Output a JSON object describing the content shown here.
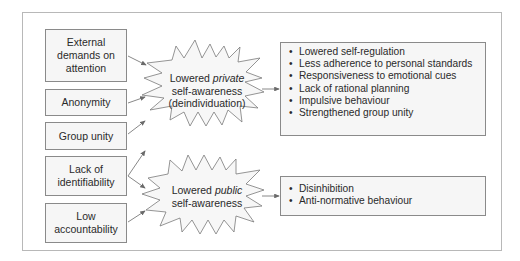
{
  "causes": [
    {
      "label": "External demands on attention"
    },
    {
      "label": "Anonymity"
    },
    {
      "label": "Group unity"
    },
    {
      "label": "Lack of identifiability"
    },
    {
      "label": "Low accountability"
    }
  ],
  "states": {
    "private": {
      "prefix": "Lowered ",
      "emph": "private",
      "line2": "self-awareness",
      "line3": "(deindividuation)"
    },
    "public": {
      "prefix": "Lowered ",
      "emph": "public",
      "line2": "self-awareness"
    }
  },
  "outcomes": {
    "private": [
      "Lowered self-regulation",
      "Less adherence to personal standards",
      "Responsiveness to emotional cues",
      "Lack of rational planning",
      "Impulsive behaviour",
      "Strengthened group unity"
    ],
    "public": [
      "Disinhibition",
      "Anti-normative behaviour"
    ]
  },
  "colors": {
    "box_border": "#8a8a8a",
    "box_fill": "#f6f6f6",
    "frame": "#b8b8b8",
    "arrow": "#6a6a6a"
  }
}
